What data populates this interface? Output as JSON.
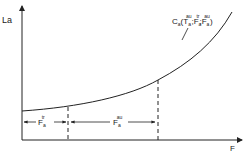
{
  "diagram": {
    "y_axis_label": "La",
    "x_axis_label": "F",
    "curve_label": {
      "main": "C",
      "main_sub": "a",
      "open": "(",
      "t1": "T",
      "t1_sup": "au",
      "t1_sub": "a",
      "sep1": ";",
      "t2": "F",
      "t2_sup": "tr",
      "t2_sub": "a",
      "sep2": ";",
      "t3": "F",
      "t3_sup": "au",
      "t3_sub": "a",
      "close": ")"
    },
    "interval_1": {
      "label": "F",
      "sup": "tr",
      "sub": "a"
    },
    "interval_2": {
      "label": "F",
      "sup": "au",
      "sub": "a"
    },
    "colors": {
      "ink": "#222222",
      "background": "#ffffff"
    }
  }
}
